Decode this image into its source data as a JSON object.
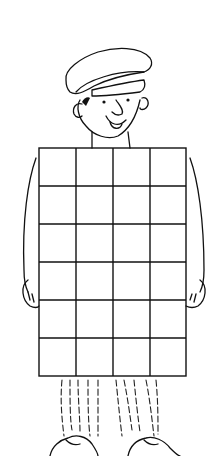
{
  "illustration": {
    "subject": "man-with-cap-holding-grid",
    "colors": {
      "line": "#111111",
      "background": "#ffffff"
    },
    "grid": {
      "columns": 4,
      "rows": 6,
      "x": 39,
      "y": 148,
      "width": 147,
      "height": 228
    }
  }
}
